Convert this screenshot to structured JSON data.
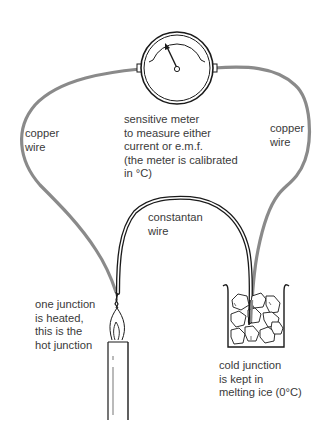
{
  "diagram": {
    "colors": {
      "copper_wire": "#8a8a8a",
      "constantan_wire": "#1a1a1a",
      "ink": "#1a1a1a",
      "text": "#3a3a3a",
      "background": "#ffffff"
    },
    "labels": {
      "copper_wire_left": "copper\nwire",
      "copper_wire_right": "copper\nwire",
      "meter": "sensitive meter\nto measure either\ncurrent or e.m.f.\n(the meter is calibrated\nin °C)",
      "constantan_wire": "constantan\nwire",
      "hot_junction": "one junction\nis heated,\nthis is the\nhot junction",
      "cold_junction": "cold junction\nis kept in\nmelting ice (0°C)"
    },
    "components": [
      {
        "id": "meter",
        "type": "gauge"
      },
      {
        "id": "copper-wire-left",
        "type": "wire"
      },
      {
        "id": "copper-wire-right",
        "type": "wire"
      },
      {
        "id": "constantan-wire",
        "type": "wire"
      },
      {
        "id": "hot-junction",
        "type": "junction"
      },
      {
        "id": "candle",
        "type": "heat-source"
      },
      {
        "id": "cold-junction",
        "type": "junction"
      },
      {
        "id": "ice-beaker",
        "type": "container"
      }
    ]
  }
}
